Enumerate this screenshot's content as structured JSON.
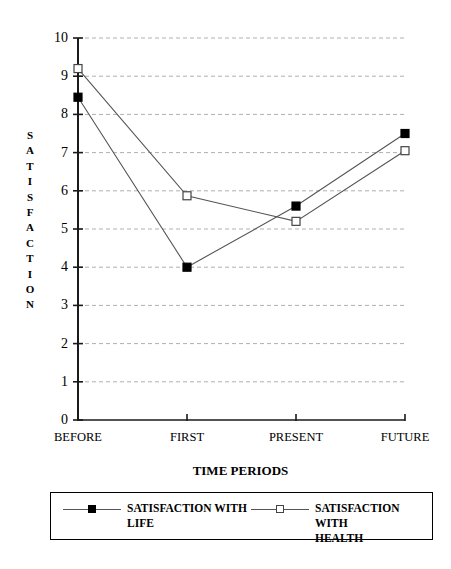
{
  "chart_data": {
    "type": "line",
    "title": "",
    "xlabel": "TIME PERIODS",
    "ylabel": "SATISFACTION",
    "categories": [
      "BEFORE",
      "FIRST",
      "PRESENT",
      "FUTURE"
    ],
    "ylim": [
      0,
      10
    ],
    "ytick_labels": [
      "10",
      "9",
      "8",
      "7",
      "6",
      "5",
      "4",
      "3",
      "2",
      "1",
      "0"
    ],
    "ytick_values": [
      10,
      9,
      8,
      7,
      6,
      5,
      4,
      3,
      2,
      1,
      0
    ],
    "grid": true,
    "grid_axis": "y",
    "grid_style": "dashed",
    "grid_color": "#b0b0b0",
    "legend_position": "below-plot",
    "series": [
      {
        "name": "SATISFACTION WITH LIFE",
        "marker": "filled-square",
        "color": "#000000",
        "values": [
          8.45,
          4.0,
          5.6,
          7.5
        ]
      },
      {
        "name": "SATISFACTION WITH HEALTH",
        "marker": "open-square",
        "color": "#000000",
        "values": [
          9.2,
          5.87,
          5.2,
          7.05
        ]
      }
    ]
  },
  "axis": {
    "y_title_letters": [
      "S",
      "A",
      "T",
      "I",
      "S",
      "F",
      "A",
      "C",
      "T",
      "I",
      "O",
      "N"
    ],
    "x_title": "TIME PERIODS"
  },
  "legend": {
    "entries": [
      {
        "label": "SATISFACTION WITH\nLIFE",
        "marker": "filled-square"
      },
      {
        "label": "SATISFACTION WITH\nHEALTH",
        "marker": "open-square"
      }
    ]
  }
}
